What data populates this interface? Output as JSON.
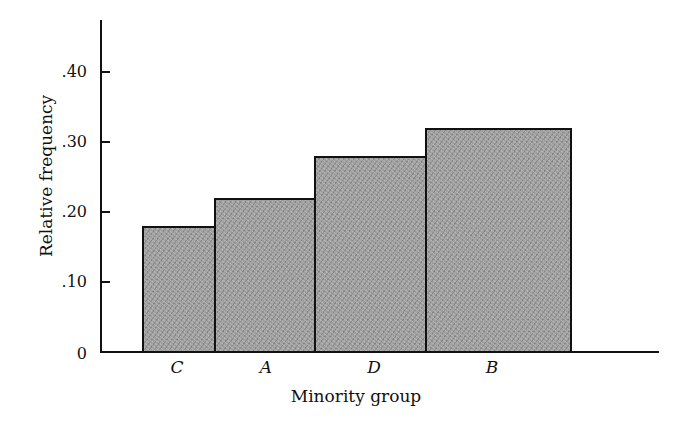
{
  "chart_data": {
    "type": "bar",
    "title": "",
    "xlabel": "Minority group",
    "ylabel": "Relative frequency",
    "categories": [
      "C",
      "A",
      "D",
      "B"
    ],
    "values": [
      0.18,
      0.22,
      0.28,
      0.32
    ],
    "ylim": [
      0,
      0.47
    ],
    "yticks": [
      0,
      0.1,
      0.2,
      0.3,
      0.4
    ],
    "ytick_labels": [
      "0",
      ".10",
      ".20",
      ".30",
      ".40"
    ],
    "grid": false,
    "legend": null,
    "bar_style": "adjacent bars, gray stippled fill, black outline",
    "colors": {
      "bar_fill": "#9c9c9c",
      "outline": "#111111"
    }
  }
}
